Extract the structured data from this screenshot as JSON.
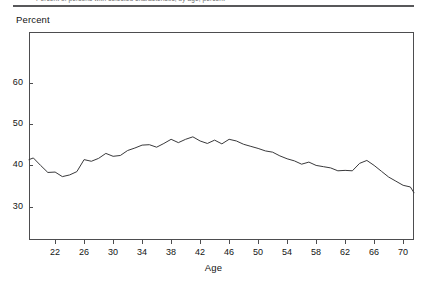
{
  "caption": {
    "text": "Percent of persons with selected characteristic, by age, percent",
    "rule_color": "#58585a"
  },
  "axis_titles": {
    "y": "Percent",
    "x": "Age"
  },
  "chart_data": {
    "type": "line",
    "title": "",
    "subtitle": "",
    "xlabel": "Age",
    "ylabel": "Percent",
    "xlim": [
      18.4,
      71.5
    ],
    "ylim": [
      22.0,
      72.2
    ],
    "xticks": [
      22,
      26,
      30,
      34,
      38,
      42,
      46,
      50,
      54,
      58,
      62,
      66,
      70
    ],
    "xtick_labels": [
      "22",
      "26",
      "30",
      "34",
      "38",
      "42",
      "46",
      "50",
      "54",
      "58",
      "62",
      "66",
      "70"
    ],
    "yticks": [
      30,
      40,
      50,
      60
    ],
    "ytick_labels": [
      "30",
      "40",
      "50",
      "60"
    ],
    "grid": false,
    "legend": null,
    "line_color": "#39393b",
    "line_width": 1,
    "series": [
      {
        "name": "Percent",
        "x": [
          18.4,
          19,
          20,
          21,
          22,
          23,
          24,
          25,
          26,
          27,
          28,
          29,
          30,
          31,
          32,
          33,
          34,
          35,
          36,
          37,
          38,
          39,
          40,
          41,
          42,
          43,
          44,
          45,
          46,
          47,
          48,
          49,
          50,
          51,
          52,
          53,
          54,
          55,
          56,
          57,
          58,
          59,
          60,
          61,
          62,
          63,
          64,
          65,
          66,
          67,
          68,
          69,
          70,
          71,
          71.5
        ],
        "values": [
          41.4,
          41.8,
          40.0,
          38.3,
          38.4,
          37.3,
          37.7,
          38.5,
          41.4,
          41.0,
          41.7,
          42.9,
          42.2,
          42.4,
          43.6,
          44.2,
          44.9,
          45.0,
          44.4,
          45.3,
          46.3,
          45.5,
          46.3,
          46.9,
          45.9,
          45.3,
          46.1,
          45.2,
          46.3,
          45.9,
          45.1,
          44.6,
          44.1,
          43.5,
          43.2,
          42.3,
          41.6,
          41.1,
          40.3,
          40.8,
          40.0,
          39.7,
          39.4,
          38.7,
          38.8,
          38.7,
          40.5,
          41.2,
          40.0,
          38.6,
          37.2,
          36.2,
          35.2,
          34.8,
          33.4
        ]
      }
    ]
  }
}
